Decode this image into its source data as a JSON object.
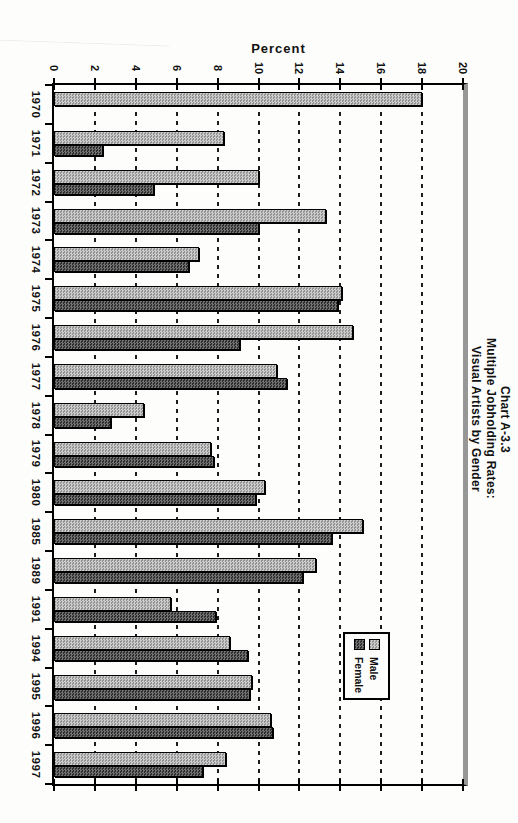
{
  "page": {
    "background": "#fdfdfc"
  },
  "chart_data": {
    "type": "bar",
    "orientation": "horizontal-bars (original column chart printed rotated 90deg clockwise on portrait page)",
    "title_lines": [
      "Chart A-3.3",
      "Multiple Jobholding Rates:",
      "Visual Artists by Gender"
    ],
    "axis_title": "Percent",
    "axis_range": [
      0,
      20
    ],
    "axis_ticks": [
      0,
      2,
      4,
      6,
      8,
      10,
      12,
      14,
      16,
      18,
      20
    ],
    "grid": "dashed gridline at every 2 percent",
    "legend_position": "inside plot, near 1991-1995 rows",
    "categories": [
      "1970",
      "1971",
      "1972",
      "1973",
      "1974",
      "1975",
      "1976",
      "1977",
      "1978",
      "1979",
      "1980",
      "1985",
      "1989",
      "1991",
      "1994",
      "1995",
      "1996",
      "1997"
    ],
    "series": [
      {
        "name": "Male",
        "color": "#b8b8b8",
        "values": [
          18.0,
          8.3,
          10.0,
          13.3,
          7.1,
          14.1,
          14.6,
          10.9,
          4.4,
          7.7,
          10.3,
          15.1,
          12.8,
          5.7,
          8.6,
          9.7,
          10.6,
          8.4
        ]
      },
      {
        "name": "Female",
        "color": "#3a3a3a",
        "values": [
          null,
          2.4,
          4.9,
          10.0,
          6.6,
          13.9,
          9.1,
          11.4,
          2.8,
          7.8,
          9.9,
          13.6,
          12.2,
          7.9,
          9.5,
          9.6,
          10.7,
          7.3
        ]
      }
    ],
    "colors": {
      "axis": "#111111",
      "grid": "#1c1c1c",
      "plot_right_edge": "#979797"
    }
  }
}
